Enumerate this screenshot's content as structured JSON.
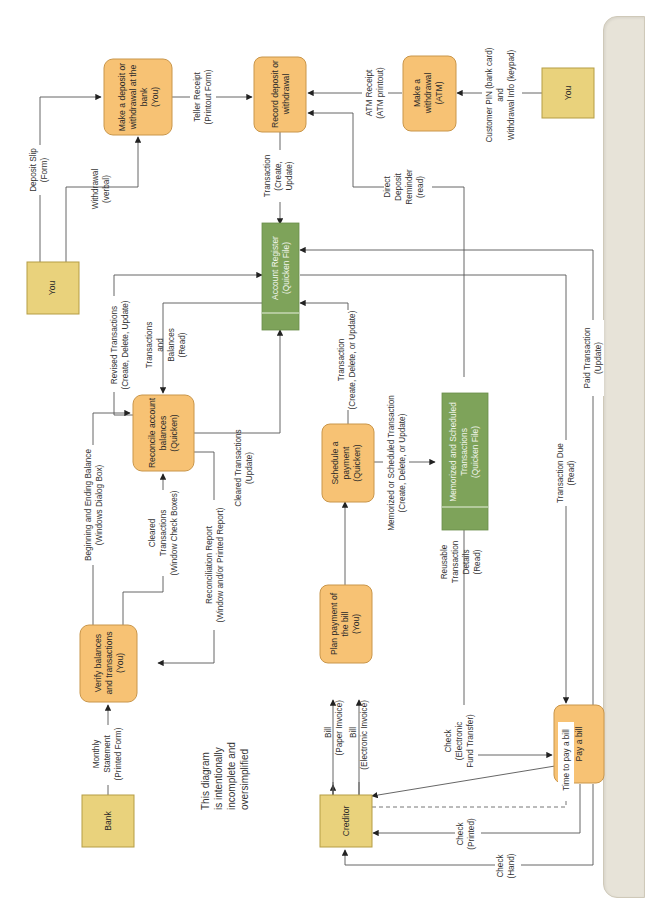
{
  "diagram": {
    "orientation": "rotated 90 degrees counterclockwise",
    "colors": {
      "process_fill": "#f7c274",
      "entity_fill": "#e9d27c",
      "data_store_fill": "#7ea35a",
      "side_panel": "#e7e3d8",
      "line": "#555555"
    },
    "external_entities": {
      "you_top": "You",
      "you_right": "You",
      "bank": "Bank",
      "creditor": "Creditor"
    },
    "processes": {
      "deposit_bank": [
        "Make a deposit or",
        "withdrawal at the",
        "bank",
        "(You)"
      ],
      "record": [
        "Record deposit or",
        "withdrawal"
      ],
      "atm": [
        "Make a",
        "withdrawal",
        "(ATM)"
      ],
      "reconcile": [
        "Reconcile account",
        "balances",
        "(Quicken)"
      ],
      "verify": [
        "Verify balances",
        "and transactions",
        "(You)"
      ],
      "schedule": [
        "Schedule a",
        "payment",
        "(Quicken)"
      ],
      "plan": [
        "Plan payment of",
        "the bill",
        "(You)"
      ],
      "pay": [
        "Pay a bill"
      ]
    },
    "data_stores": {
      "account_register": [
        "Account Register",
        "(Quicken File)"
      ],
      "memorized": [
        "Memorized and Scheduled",
        "Transactions",
        "(Quicken File)"
      ]
    },
    "flows": {
      "deposit_slip": [
        "Deposit Slip",
        "(Form)"
      ],
      "withdrawal_verbal": [
        "Withdrawal",
        "(verbal)"
      ],
      "teller_receipt": [
        "Teller Receipt",
        "(Printout Form)"
      ],
      "atm_receipt": [
        "ATM Receipt",
        "(ATM printout)"
      ],
      "customer_pin": [
        "Customer PIN (bank card)",
        "and",
        "Withdrawal Info (keypad)"
      ],
      "transaction_create_update": [
        "Transaction",
        "(Create,",
        "Update)"
      ],
      "direct_deposit": [
        "Direct",
        "Deposit",
        "Reminder",
        "(read)"
      ],
      "revised_transactions": [
        "Revised Transactions",
        "(Create, Delete, Update)"
      ],
      "transactions_balances": [
        "Transactions",
        "and",
        "Balances",
        "(Read)"
      ],
      "cleared_update": [
        "Cleared Transactions",
        "(Update)"
      ],
      "transaction_cdu": [
        "Transaction",
        "(Create, Delete, or Update)"
      ],
      "beginning_ending": [
        "Beginning and Ending Balance",
        "(Windows Dialog Box)"
      ],
      "cleared_checkboxes": [
        "Cleared",
        "Transactions",
        "(Window Check Boxes)"
      ],
      "reconciliation_report": [
        "Reconciliation Report",
        "(Window and/or Printed Report)"
      ],
      "memorized_flow": [
        "Memorized or Scheduled Transaction",
        "(Create, Delete, or Update)"
      ],
      "transaction_due": [
        "Transaction Due",
        "(Read)"
      ],
      "paid_transaction": [
        "Paid Transaction",
        "(Update)"
      ],
      "reusable": [
        "Reusable",
        "Transaction",
        "Details",
        "(Read)"
      ],
      "monthly_statement": [
        "Monthly",
        "Statement",
        "(Printed Form)"
      ],
      "bill_paper": [
        "Bill",
        "(Paper Invoice)"
      ],
      "bill_electronic": [
        "Bill",
        "(Electronic Invoice)"
      ],
      "check_eft": [
        "Check",
        "(Electronic",
        "Fund Transfer)"
      ],
      "time_to_pay": [
        "Time to pay a bill"
      ],
      "check_printed": [
        "Check",
        "(Printed)"
      ],
      "check_hand": [
        "Check",
        "(Hand)"
      ]
    },
    "note": [
      "This diagram",
      "is intentionally",
      "incomplete and",
      "oversimplified"
    ]
  }
}
